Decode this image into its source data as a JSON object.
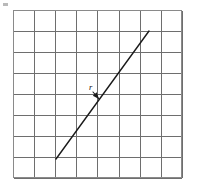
{
  "figure": {
    "background_color": "#ffffff",
    "labels": [
      {
        "id": "vector-label-r",
        "text": "r",
        "x": 89,
        "y": 90,
        "style": "italic"
      }
    ],
    "corner_mark": {
      "name": "corner-tick-mark",
      "x": 3,
      "y": 3,
      "width": 5,
      "height": 3,
      "color": "#b9b9b9"
    }
  },
  "chart_data": {
    "type": "diagram",
    "title": "",
    "xlabel": "",
    "ylabel": "",
    "grid": {
      "visible": true,
      "columns": 8,
      "rows": 8,
      "cell_width": 21.1,
      "cell_height": 21,
      "origin_x": 13,
      "origin_y": 10,
      "width": 169,
      "height": 168,
      "line_color": "#6e6e6e",
      "border_color": "#8a8a8a"
    },
    "vectors": [
      {
        "name": "vector-r",
        "label": "r",
        "start": [
          56,
          159
        ],
        "end": [
          149,
          31
        ],
        "grid_start": [
          2,
          1
        ],
        "grid_end": [
          6.45,
          7.1
        ],
        "color": "#1a1a1a",
        "line_width": 1.4
      }
    ],
    "annotations": [
      {
        "name": "label-pointer-arrow",
        "label": "r",
        "from": [
          93,
          92
        ],
        "to": [
          99,
          99
        ],
        "arrow_head": true,
        "color": "#1a1a1a"
      }
    ],
    "legend": {
      "visible": false
    },
    "axes": {
      "visible": false
    }
  }
}
